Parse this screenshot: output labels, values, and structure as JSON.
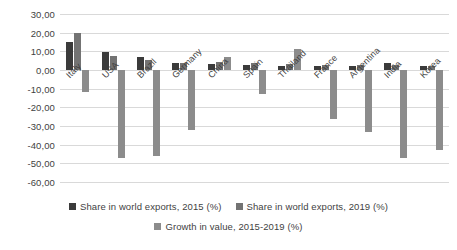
{
  "chart_data": {
    "type": "bar",
    "title": "",
    "subtitle": "",
    "xlabel": "",
    "ylabel": "",
    "ylim": [
      -60,
      30
    ],
    "ytick_step": 10,
    "grid": true,
    "legend_position": "bottom",
    "decimal_separator": ",",
    "categories": [
      "Italy",
      "USA",
      "Brazil",
      "Germany",
      "China",
      "Spain",
      "Thailand",
      "France",
      "Argentina",
      "India",
      "Korea"
    ],
    "ytick_labels": [
      "30,00",
      "20,00",
      "10,00",
      "0,00",
      "-10,00",
      "-20,00",
      "-30,00",
      "-40,00",
      "-50,00",
      "-60,00"
    ],
    "ytick_values": [
      30,
      20,
      10,
      0,
      -10,
      -20,
      -30,
      -40,
      -50,
      -60
    ],
    "series": [
      {
        "name": "Share in world exports, 2015 (%)",
        "color": "#3b3b3b",
        "values": [
          15.0,
          9.5,
          7.0,
          3.5,
          3.0,
          2.5,
          2.0,
          2.0,
          2.0,
          3.5,
          2.0
        ]
      },
      {
        "name": "Share in world exports, 2019 (%)",
        "color": "#737373",
        "values": [
          20.0,
          7.5,
          5.5,
          4.0,
          4.5,
          3.5,
          3.0,
          2.5,
          2.5,
          2.5,
          2.0
        ]
      },
      {
        "name": "Growth in value, 2015-2019 (%)",
        "color": "#8c8c8c",
        "values": [
          -12.0,
          -47.0,
          -46.0,
          -32.0,
          7.0,
          -13.0,
          11.0,
          -26.0,
          -33.0,
          -47.0,
          -43.0
        ]
      }
    ]
  },
  "legend": {
    "items": [
      {
        "label": "Share in world exports, 2015 (%)",
        "color": "#3b3b3b"
      },
      {
        "label": "Share in world exports, 2019 (%)",
        "color": "#737373"
      },
      {
        "label": "Growth in value, 2015-2019 (%)",
        "color": "#8c8c8c"
      }
    ]
  }
}
